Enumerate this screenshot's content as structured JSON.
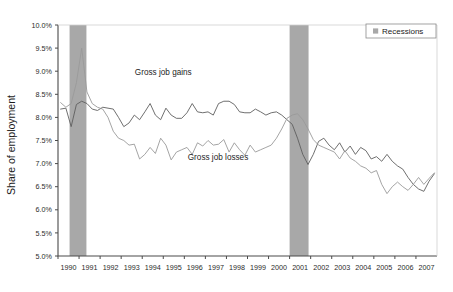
{
  "chart_data": {
    "type": "line",
    "title": "",
    "xlabel": "",
    "ylabel": "Share of employment",
    "ylim": [
      5.0,
      10.0
    ],
    "ytick_step": 0.5,
    "ytick_labels": [
      "10.0%",
      "9.5%",
      "9.0%",
      "8.5%",
      "8.0%",
      "7.5%",
      "7.0%",
      "6.5%",
      "6.0%",
      "5.5%",
      "5.0%"
    ],
    "ytick_values": [
      10.0,
      9.5,
      9.0,
      8.5,
      8.0,
      7.5,
      7.0,
      6.5,
      6.0,
      5.5,
      5.0
    ],
    "xlim": [
      1990.0,
      2008.0
    ],
    "xtick_labels": [
      "1990",
      "1991",
      "1992",
      "1993",
      "1994",
      "1995",
      "1996",
      "1997",
      "1998",
      "1999",
      "2000",
      "2001",
      "2002",
      "2003",
      "2004",
      "2005",
      "2006",
      "2007"
    ],
    "xtick_values": [
      1990,
      1991,
      1992,
      1993,
      1994,
      1995,
      1996,
      1997,
      1998,
      1999,
      2000,
      2001,
      2002,
      2003,
      2004,
      2005,
      2006,
      2007
    ],
    "grid": false,
    "legend_position": "top-right",
    "legend_entries": [
      {
        "label": "Recessions",
        "color": "#a8a8a8",
        "marker": "square"
      }
    ],
    "annotations": [
      {
        "text": "Gross job gains",
        "x": 1995.0,
        "y": 8.92,
        "series": "Gross job gains"
      },
      {
        "text": "Gross job losses",
        "x": 1997.6,
        "y": 7.08,
        "series": "Gross job losses"
      }
    ],
    "shaded_regions": [
      {
        "label": "Recession",
        "x_start": 1990.55,
        "x_end": 1991.35,
        "color": "#a8a8a8"
      },
      {
        "label": "Recession",
        "x_start": 2001.0,
        "x_end": 2001.9,
        "color": "#a8a8a8"
      }
    ],
    "x": [
      1990.125,
      1990.375,
      1990.625,
      1990.875,
      1991.125,
      1991.375,
      1991.625,
      1991.875,
      1992.125,
      1992.375,
      1992.625,
      1992.875,
      1993.125,
      1993.375,
      1993.625,
      1993.875,
      1994.125,
      1994.375,
      1994.625,
      1994.875,
      1995.125,
      1995.375,
      1995.625,
      1995.875,
      1996.125,
      1996.375,
      1996.625,
      1996.875,
      1997.125,
      1997.375,
      1997.625,
      1997.875,
      1998.125,
      1998.375,
      1998.625,
      1998.875,
      1999.125,
      1999.375,
      1999.625,
      1999.875,
      2000.125,
      2000.375,
      2000.625,
      2000.875,
      2001.125,
      2001.375,
      2001.625,
      2001.875,
      2002.125,
      2002.375,
      2002.625,
      2002.875,
      2003.125,
      2003.375,
      2003.625,
      2003.875,
      2004.125,
      2004.375,
      2004.625,
      2004.875,
      2005.125,
      2005.375,
      2005.625,
      2005.875,
      2006.125,
      2006.375,
      2006.625,
      2006.875,
      2007.125,
      2007.375,
      2007.625,
      2007.875
    ],
    "series": [
      {
        "name": "Gross job gains",
        "color": "#5f5f5f",
        "width": 0.9,
        "values": [
          8.18,
          8.2,
          7.8,
          8.28,
          8.35,
          8.3,
          8.18,
          8.15,
          8.22,
          8.2,
          8.18,
          8.0,
          7.8,
          7.88,
          8.05,
          7.95,
          8.12,
          8.3,
          8.05,
          7.95,
          8.2,
          8.05,
          7.98,
          7.98,
          8.1,
          8.3,
          8.12,
          8.1,
          8.12,
          8.05,
          8.3,
          8.35,
          8.35,
          8.28,
          8.12,
          8.1,
          8.1,
          8.18,
          8.12,
          8.05,
          8.1,
          8.12,
          8.05,
          7.95,
          7.85,
          7.55,
          7.2,
          6.98,
          7.2,
          7.48,
          7.55,
          7.4,
          7.3,
          7.45,
          7.25,
          7.38,
          7.2,
          7.35,
          7.28,
          7.1,
          7.15,
          7.05,
          7.2,
          7.05,
          6.95,
          6.88,
          6.7,
          6.55,
          6.45,
          6.4,
          6.62,
          6.78
        ]
      },
      {
        "name": "Gross job losses",
        "color": "#9a9a9a",
        "width": 0.9,
        "values": [
          8.32,
          8.22,
          8.3,
          8.75,
          9.5,
          8.55,
          8.3,
          8.22,
          8.18,
          8.0,
          7.7,
          7.55,
          7.5,
          7.4,
          7.42,
          7.1,
          7.2,
          7.35,
          7.22,
          7.55,
          7.4,
          7.08,
          7.25,
          7.3,
          7.35,
          7.2,
          7.45,
          7.38,
          7.5,
          7.4,
          7.42,
          7.52,
          7.25,
          7.45,
          7.3,
          7.18,
          7.4,
          7.25,
          7.3,
          7.35,
          7.4,
          7.55,
          7.75,
          7.98,
          8.05,
          8.08,
          7.95,
          7.75,
          7.52,
          7.4,
          7.35,
          7.3,
          7.25,
          7.1,
          7.28,
          7.12,
          7.05,
          6.95,
          6.9,
          6.8,
          6.85,
          6.55,
          6.35,
          6.5,
          6.6,
          6.5,
          6.42,
          6.55,
          6.7,
          6.55,
          6.68,
          6.8
        ]
      }
    ]
  },
  "footnote": {
    "text": ""
  }
}
